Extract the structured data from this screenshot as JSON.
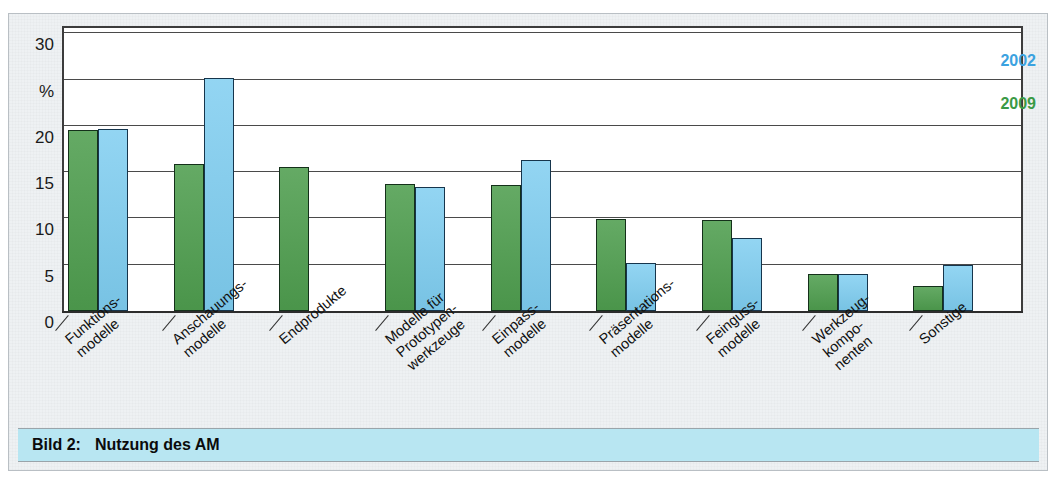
{
  "caption": {
    "label": "Bild 2:",
    "text": "Nutzung des AM"
  },
  "legend": {
    "items": [
      {
        "label": "2002",
        "color": "#3ba2e0"
      },
      {
        "label": "2009",
        "color": "#3a9a45"
      }
    ]
  },
  "axis": {
    "unit": "%",
    "ticks": [
      "30",
      "%",
      "20",
      "15",
      "10",
      "5",
      "0"
    ]
  },
  "chart_data": {
    "type": "bar",
    "title": "Nutzung des AM",
    "xlabel": "",
    "ylabel": "%",
    "ylim": [
      0,
      31
    ],
    "yticks": [
      0,
      5,
      10,
      15,
      20,
      25,
      30
    ],
    "ytick_labels": [
      "0",
      "5",
      "10",
      "15",
      "20",
      "%",
      "30"
    ],
    "grid": true,
    "legend_position": "top-right",
    "categories": [
      "Funktions-\nmodelle",
      "Anschauungs-\nmodelle",
      "Endprodukte",
      "Modelle für\nPrototypen-\nwerkzeuge",
      "Einpass-\nmodelle",
      "Präsentations-\nmodelle",
      "Feinguss-\nmodelle",
      "Werkzeug-\nkompo-\nnenten",
      "Sonstige"
    ],
    "series": [
      {
        "name": "2009",
        "color": "#4f9e4f",
        "values": [
          19.5,
          15.9,
          15.6,
          13.7,
          13.6,
          9.9,
          9.8,
          4.0,
          2.7
        ]
      },
      {
        "name": "2002",
        "color": "#7ecdf0",
        "values": [
          19.7,
          25.2,
          null,
          13.4,
          16.3,
          5.2,
          7.9,
          4.0,
          5.0
        ]
      }
    ]
  }
}
